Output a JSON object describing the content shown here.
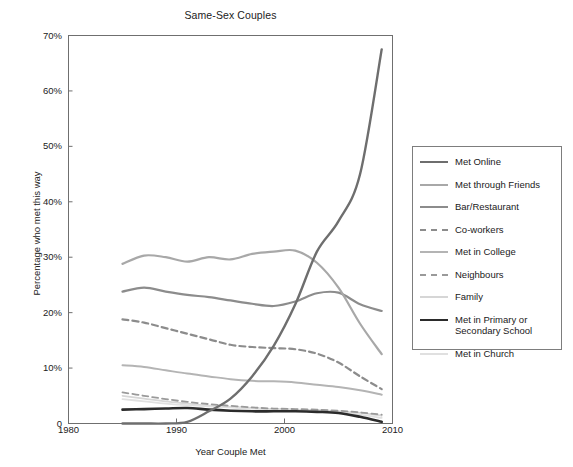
{
  "chart_data": {
    "type": "line",
    "title": "Same-Sex Couples",
    "xlabel": "Year Couple Met",
    "ylabel": "Percentage who met this way",
    "xlim": [
      1980,
      2010
    ],
    "ylim": [
      0,
      70
    ],
    "xticks": [
      "1980",
      "1990",
      "2000",
      "2010"
    ],
    "xtick_values": [
      1980,
      1990,
      2000,
      2010
    ],
    "yticks": [
      "0",
      "10%",
      "20%",
      "30%",
      "40%",
      "50%",
      "60%",
      "70%"
    ],
    "ytick_values": [
      0,
      10,
      20,
      30,
      40,
      50,
      60,
      70
    ],
    "grid": false,
    "legend_position": "right",
    "x": [
      1985,
      1987,
      1989,
      1991,
      1993,
      1995,
      1997,
      1999,
      2001,
      2003,
      2005,
      2007,
      2009
    ],
    "series": [
      {
        "name": "Met Online",
        "color": "#6e6e6e",
        "style": "solid",
        "width": 2.4,
        "values": [
          0,
          0,
          0,
          0.3,
          2.2,
          4.5,
          8.5,
          14.0,
          21.5,
          31.0,
          36.5,
          45.0,
          67.5
        ]
      },
      {
        "name": "Met through Friends",
        "color": "#a8a8a8",
        "style": "solid",
        "width": 2.2,
        "values": [
          28.8,
          30.3,
          30.0,
          29.2,
          30.0,
          29.6,
          30.6,
          31.0,
          31.2,
          29.0,
          24.5,
          18.0,
          12.5
        ]
      },
      {
        "name": "Bar/Restaurant",
        "color": "#8c8c8c",
        "style": "solid",
        "width": 2.2,
        "values": [
          23.8,
          24.5,
          23.8,
          23.2,
          22.8,
          22.2,
          21.6,
          21.2,
          22.0,
          23.5,
          23.6,
          21.5,
          20.3
        ]
      },
      {
        "name": "Co-workers",
        "color": "#8c8c8c",
        "style": "dashed",
        "width": 2.2,
        "values": [
          18.8,
          18.2,
          17.2,
          16.2,
          15.2,
          14.2,
          13.8,
          13.6,
          13.4,
          12.6,
          11.0,
          8.5,
          6.2
        ]
      },
      {
        "name": "Met in College",
        "color": "#b4b4b4",
        "style": "solid",
        "width": 2.0,
        "values": [
          10.5,
          10.2,
          9.6,
          9.0,
          8.5,
          8.0,
          7.7,
          7.6,
          7.4,
          7.0,
          6.6,
          6.0,
          5.2
        ]
      },
      {
        "name": "Neighbours",
        "color": "#9a9a9a",
        "style": "dashed",
        "width": 1.8,
        "values": [
          5.6,
          5.0,
          4.4,
          3.9,
          3.5,
          3.2,
          2.9,
          2.7,
          2.6,
          2.5,
          2.3,
          2.0,
          1.6
        ]
      },
      {
        "name": "Family",
        "color": "#d6d6d6",
        "style": "solid",
        "width": 1.8,
        "values": [
          5.0,
          4.5,
          4.0,
          3.6,
          3.2,
          3.0,
          2.8,
          2.6,
          2.5,
          2.4,
          2.2,
          1.9,
          1.4
        ]
      },
      {
        "name": "Met in Primary or\nSecondary School",
        "color": "#2b2b2b",
        "style": "solid",
        "width": 2.6,
        "values": [
          2.5,
          2.6,
          2.7,
          2.8,
          2.5,
          2.3,
          2.2,
          2.2,
          2.2,
          2.1,
          1.9,
          1.2,
          0.3
        ]
      },
      {
        "name": "Met in Church",
        "color": "#e0e0e0",
        "style": "solid",
        "width": 1.8,
        "values": [
          4.4,
          4.0,
          3.6,
          3.3,
          3.1,
          2.9,
          2.7,
          2.6,
          2.5,
          2.3,
          2.0,
          1.6,
          1.0
        ]
      }
    ]
  }
}
